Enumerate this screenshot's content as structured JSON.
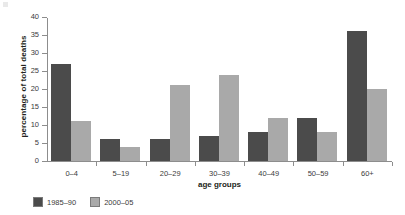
{
  "chart_data": {
    "type": "bar",
    "title": "",
    "xlabel": "age groups",
    "ylabel": "percentage of total deaths",
    "categories": [
      "0–4",
      "5–19",
      "20–29",
      "30–39",
      "40–49",
      "50–59",
      "60+"
    ],
    "series": [
      {
        "name": "1985–90",
        "color": "#4b4b4b",
        "values": [
          27,
          6,
          6,
          7,
          8,
          12,
          36
        ]
      },
      {
        "name": "2000–05",
        "color": "#a9a9a9",
        "values": [
          11,
          4,
          21,
          24,
          12,
          8,
          20
        ]
      }
    ],
    "ylim": [
      0,
      40
    ],
    "yticks": [
      0,
      5,
      10,
      15,
      20,
      25,
      30,
      35,
      40
    ],
    "ytick_labels": [
      "0",
      "5",
      "10",
      "15",
      "20",
      "25",
      "30",
      "35",
      "40"
    ],
    "grid": false,
    "legend_position": "bottom-left"
  }
}
